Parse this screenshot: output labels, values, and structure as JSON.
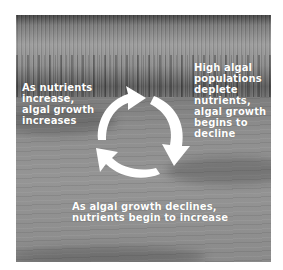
{
  "figure": {
    "background": "grayscale photo of reeds along a lake with water in foreground",
    "labels": {
      "left": "As nutrients\nincrease,\nalgal growth\nincreases",
      "right": "High algal\npopulations\ndeplete\nnutrients,\nalgal growth\nbegins to\ndecline",
      "bottom": "As algal growth declines,\nnutrients begin to increase"
    },
    "cycle": {
      "arrow_count": 3,
      "direction": "clockwise",
      "arrow_color": "#ffffff"
    }
  }
}
